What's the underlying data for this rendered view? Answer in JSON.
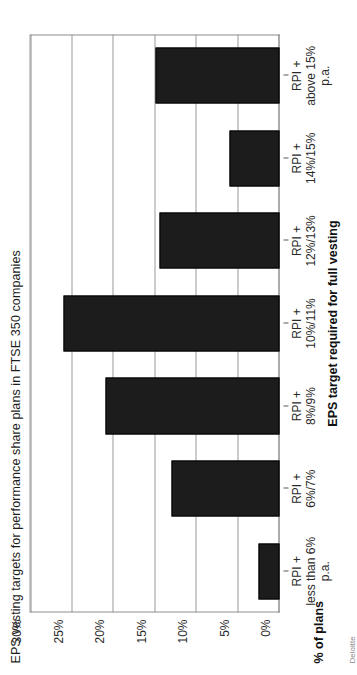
{
  "chart_data": {
    "type": "bar",
    "title": "EPS vesting targets for performance share plans in FTSE 350 companies",
    "xlabel": "EPS target required for full vesting",
    "ylabel": "% of plans",
    "categories": [
      "RPI +\nless than 6%\np.a.",
      "RPI +\n6%/7%",
      "RPI +\n8%/9%",
      "RPI +\n10%/11%",
      "RPI +\n12%/13%",
      "RPI +\n14%/15%",
      "RPI +\nabove 15%\np.a."
    ],
    "category_lines": [
      [
        "RPI +",
        "less than 6%",
        "p.a."
      ],
      [
        "RPI +",
        "6%/7%"
      ],
      [
        "RPI +",
        "8%/9%"
      ],
      [
        "RPI +",
        "10%/11%"
      ],
      [
        "RPI +",
        "12%/13%"
      ],
      [
        "RPI +",
        "14%/15%"
      ],
      [
        "RPI +",
        "above 15%",
        "p.a."
      ]
    ],
    "values": [
      2.5,
      13,
      21,
      26,
      14.5,
      6,
      15
    ],
    "ylim": [
      0,
      30
    ],
    "ytick_labels": [
      "0%",
      "5%",
      "10%",
      "15%",
      "20%",
      "25%",
      "30%"
    ],
    "ytick_values": [
      0,
      5,
      10,
      15,
      20,
      25,
      30
    ],
    "grid": "horizontal",
    "legend": "none",
    "bar_color": "#1c1c1c"
  },
  "footer": {
    "source_note": "Deloitte"
  }
}
